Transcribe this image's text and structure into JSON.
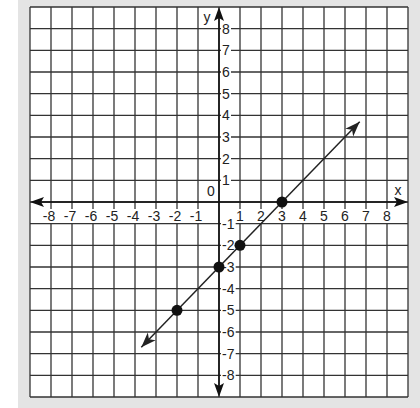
{
  "chart_data": {
    "type": "line",
    "title": "",
    "xlabel": "x",
    "ylabel": "y",
    "origin_label": "0",
    "xlim": [
      -9,
      9
    ],
    "ylim": [
      -9,
      9
    ],
    "grid": true,
    "x_ticks": [
      -8,
      -7,
      -6,
      -5,
      -4,
      -3,
      -2,
      -1,
      1,
      2,
      3,
      4,
      5,
      6,
      7,
      8
    ],
    "y_ticks": [
      8,
      7,
      6,
      5,
      4,
      3,
      2,
      1,
      -1,
      -2,
      -3,
      -4,
      -5,
      -6,
      -7,
      -8
    ],
    "series": [
      {
        "name": "line",
        "equation": "y = x - 3",
        "slope": 1,
        "intercept": -3,
        "arrow_start": [
          -3.7,
          -6.7
        ],
        "arrow_end": [
          6.7,
          3.7
        ],
        "points": [
          [
            -2,
            -5
          ],
          [
            0,
            -3
          ],
          [
            1,
            -2
          ],
          [
            3,
            0
          ]
        ]
      }
    ],
    "colors": {
      "grid": "#333333",
      "line": "#222222",
      "points": "#111111",
      "frame": "#e4e4e4"
    }
  }
}
